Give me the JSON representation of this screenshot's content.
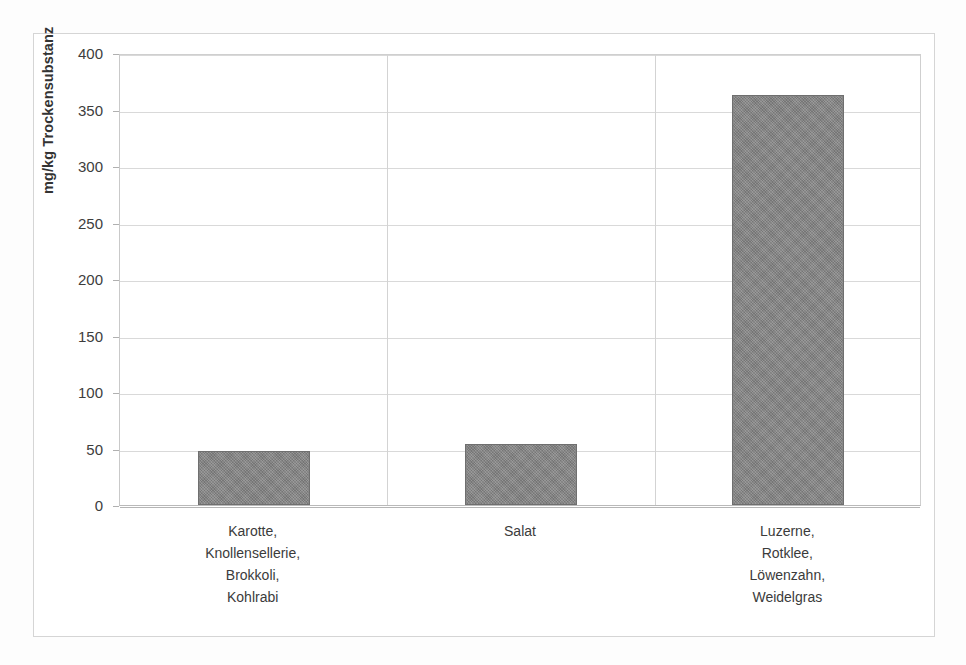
{
  "chart_data": {
    "type": "bar",
    "title": "",
    "xlabel": "",
    "ylabel": "mg/kg Trockensubstanz",
    "ylim": [
      0,
      400
    ],
    "ytick_step": 50,
    "yticks": [
      400,
      350,
      300,
      250,
      200,
      150,
      100,
      50,
      0
    ],
    "ytick_labels": [
      "400",
      "350",
      "300",
      "250",
      "200",
      "150",
      "100",
      "50",
      "0"
    ],
    "grid": true,
    "legend": false,
    "categories": [
      "Karotte, Knollensellerie, Brokkoli, Kohlrabi",
      "Salat",
      "Luzerne, Rotklee, Löwenzahn, Weidelgras"
    ],
    "category_lines": [
      [
        "Karotte,",
        "Knollensellerie,",
        "Brokkoli,",
        "Kohlrabi"
      ],
      [
        "Salat"
      ],
      [
        "Luzerne,",
        "Rotklee,",
        "Löwenzahn,",
        "Weidelgras"
      ]
    ],
    "values": [
      48,
      54,
      363
    ],
    "bar_color": "#838383",
    "bar_border_color": "#6f6f6f",
    "gridline_color": "#d9d9d9",
    "axis_color": "#b5b5b5",
    "frame_color": "#d5d5d5",
    "background_color": "#ffffff"
  }
}
